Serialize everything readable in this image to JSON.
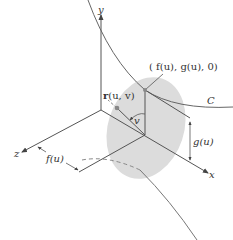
{
  "diagram": {
    "axes": {
      "x_label": "x",
      "y_label": "y",
      "z_label": "z"
    },
    "labels": {
      "point_on_curve": "( f(u), g(u), 0)",
      "curve_name": "C",
      "r_bold": "r",
      "r_args": "(u, v)",
      "angle": "v",
      "height": "g(u)",
      "distance": "f(u)"
    },
    "colors": {
      "line": "#555555",
      "surface_fill": "#d9d9d9",
      "curve": "#666666",
      "dashed": "#888888",
      "point": "#888888"
    }
  }
}
